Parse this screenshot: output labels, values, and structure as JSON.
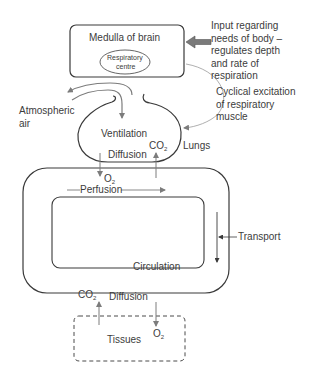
{
  "diagram": {
    "medulla": {
      "title": "Medulla of brain",
      "centre_line1": "Respiratory",
      "centre_line2": "centre"
    },
    "input_note": "Input regarding\nneeds of body –\nregulates depth\nand rate of\nrespiration",
    "excitation_note": "Cyclical excitation\nof respiratory\nmuscle",
    "atmospheric_air": "Atmospheric\nair",
    "ventilation": "Ventilation",
    "lungs": "Lungs",
    "lung_diffusion": "Diffusion",
    "lung_co2": "CO",
    "lung_co2_sub": "2",
    "lung_o2": "O",
    "lung_o2_sub": "2",
    "perfusion": "Perfusion",
    "transport": "Transport",
    "circulation": "Circulation",
    "tissue_co2": "CO",
    "tissue_co2_sub": "2",
    "tissue_diffusion": "Diffusion",
    "tissue_o2": "O",
    "tissue_o2_sub": "2",
    "tissues": "Tissues",
    "colors": {
      "line": "#3a3a3a",
      "arrow_gray": "#8a8a8a",
      "thick_arrow": "#7a7a7a",
      "text": "#3c3c3c"
    }
  }
}
